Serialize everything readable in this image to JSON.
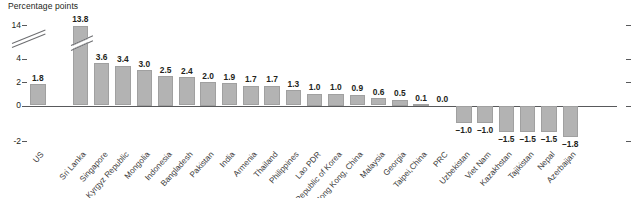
{
  "chart_data": {
    "type": "bar",
    "title": "",
    "ylabel": "Percentage points",
    "xlabel": "",
    "ylim": [
      -2,
      14
    ],
    "y_ticks": [
      {
        "value": 14,
        "label": "14"
      },
      {
        "value": 4,
        "label": "4"
      },
      {
        "value": 2,
        "label": "2"
      },
      {
        "value": 0,
        "label": "0"
      },
      {
        "value": -2,
        "label": "-2"
      }
    ],
    "axis_break": true,
    "axis_break_between": [
      4,
      14
    ],
    "grid": false,
    "legend": null,
    "categories": [
      "US",
      "Sri Lanka",
      "Singapore",
      "Kyrgyz Republic",
      "Mongolia",
      "Indonesia",
      "Bangladesh",
      "Pakistan",
      "India",
      "Armenia",
      "Thailand",
      "Philippines",
      "Lao PDR",
      "Republic of Korea",
      "Hong Kong, China",
      "Malaysia",
      "Georgia",
      "Taipei,China",
      "PRC",
      "Uzbekistan",
      "Viet Nam",
      "Kazakhstan",
      "Tajikistan",
      "Nepal",
      "Azerbaijan"
    ],
    "values": [
      1.8,
      13.8,
      3.6,
      3.4,
      3.0,
      2.5,
      2.4,
      2.0,
      1.9,
      1.7,
      1.7,
      1.3,
      1.0,
      1.0,
      0.9,
      0.6,
      0.5,
      0.1,
      0.0,
      -1.0,
      -1.0,
      -1.5,
      -1.5,
      -1.5,
      -1.8
    ],
    "value_labels": [
      "1.8",
      "13.8",
      "3.6",
      "3.4",
      "3.0",
      "2.5",
      "2.4",
      "2.0",
      "1.9",
      "1.7",
      "1.7",
      "1.3",
      "1.0",
      "1.0",
      "0.9",
      "0.6",
      "0.5",
      "0.1",
      "0.0",
      "-1.0",
      "-1.0",
      "-1.5",
      "-1.5",
      "-1.5",
      "-1.8"
    ],
    "broken_bars": [
      "Sri Lanka"
    ],
    "separator_after_index": 0,
    "bar_color": "#b3b3b3",
    "axis_color": "#58595b",
    "text_color": "#231f20"
  }
}
